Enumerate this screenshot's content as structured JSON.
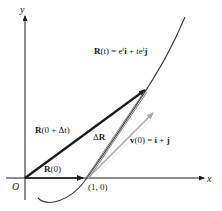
{
  "figure": {
    "axes": {
      "x_label": "x",
      "y_label": "y",
      "origin_label": "O"
    },
    "point_label": "(1, 0)",
    "curve_label": {
      "lhs_bold": "R",
      "lhs_rest": "(t) = e",
      "sup1": "t",
      "term1_vec": "i",
      "plus": " + te",
      "sup2": "t",
      "term2_vec": "j"
    },
    "vectors": {
      "r0": {
        "bold": "R",
        "rest": "(0)"
      },
      "r0dt": {
        "bold": "R",
        "rest": "(0 + Δt)"
      },
      "delta_r": {
        "delta": "Δ",
        "bold": "R"
      },
      "v0": {
        "bold": "v",
        "rest": "(0) = ",
        "i": "i",
        "plus": " + ",
        "j": "j"
      }
    },
    "colors": {
      "ink": "#1a1a1a",
      "curve": "#3a3a3a",
      "velocity": "#a8a8a8",
      "delta_r": "#6a6a6a"
    }
  }
}
